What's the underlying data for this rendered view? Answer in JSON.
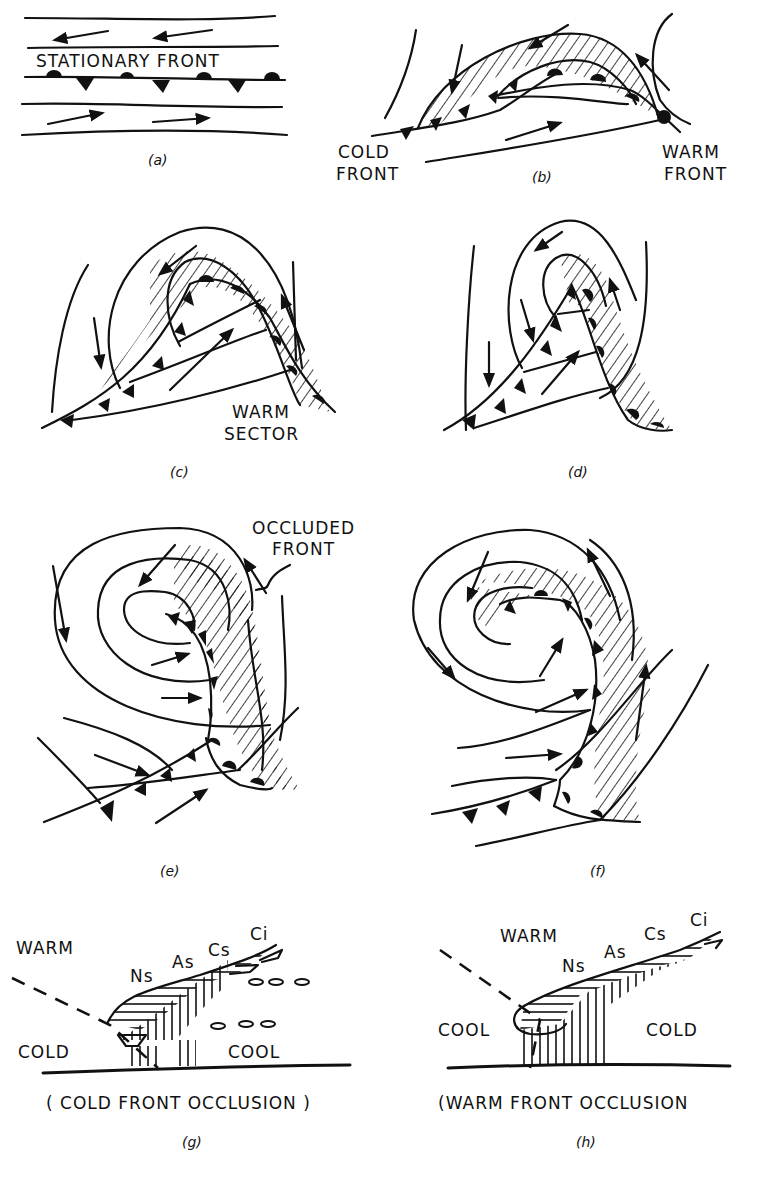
{
  "figure": {
    "panels": [
      {
        "id": "a",
        "caption": "(a)",
        "labels": [
          "STATIONARY FRONT"
        ]
      },
      {
        "id": "b",
        "caption": "(b)",
        "labels": [
          "COLD FRONT",
          "WARM FRONT"
        ]
      },
      {
        "id": "c",
        "caption": "(c)",
        "labels": [
          "WARM SECTOR"
        ]
      },
      {
        "id": "d",
        "caption": "(d)",
        "labels": []
      },
      {
        "id": "e",
        "caption": "(e)",
        "labels": [
          "OCCLUDED FRONT"
        ]
      },
      {
        "id": "f",
        "caption": "(f)",
        "labels": []
      },
      {
        "id": "g",
        "caption": "(g)",
        "title": "( COLD FRONT OCCLUSION )",
        "labels": {
          "air_upper": "WARM",
          "air_left": "COLD",
          "air_right": "COOL",
          "clouds": [
            "Ns",
            "As",
            "Cs",
            "Ci"
          ]
        }
      },
      {
        "id": "h",
        "caption": "(h)",
        "title": "(WARM FRONT OCCLUSION",
        "labels": {
          "air_upper": "WARM",
          "air_left": "COOL",
          "air_right": "COLD",
          "clouds": [
            "Ns",
            "As",
            "Cs",
            "Ci"
          ]
        }
      }
    ],
    "text": {
      "a_stationary": "STATIONARY FRONT",
      "b_cold1": "COLD",
      "b_cold2": "FRONT",
      "b_warm1": "WARM",
      "b_warm2": "FRONT",
      "c_warm1": "WARM",
      "c_warm2": "SECTOR",
      "e_occ1": "OCCLUDED",
      "e_occ2": "FRONT",
      "g_warm": "WARM",
      "g_cold": "COLD",
      "g_cool": "COOL",
      "g_ns": "Ns",
      "g_as": "As",
      "g_cs": "Cs",
      "g_ci": "Ci",
      "g_title": "( COLD FRONT OCCLUSION )",
      "h_warm": "WARM",
      "h_cool": "COOL",
      "h_cold": "COLD",
      "h_ns": "Ns",
      "h_as": "As",
      "h_cs": "Cs",
      "h_ci": "Ci",
      "h_title": "(WARM FRONT OCCLUSION",
      "cap_a": "(a)",
      "cap_b": "(b)",
      "cap_c": "(c)",
      "cap_d": "(d)",
      "cap_e": "(e)",
      "cap_f": "(f)",
      "cap_g": "(g)",
      "cap_h": "(h)"
    },
    "icons": [
      "cold-front-triangle",
      "warm-front-semicircle",
      "wind-arrow",
      "isobar-line",
      "hatched-precipitation-area"
    ],
    "colors": {
      "ink": "#111111",
      "background": "#ffffff"
    }
  }
}
